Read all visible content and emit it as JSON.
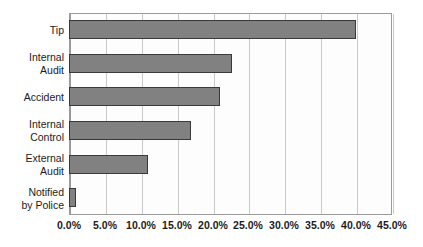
{
  "chart_data": {
    "type": "bar",
    "orientation": "horizontal",
    "title": "",
    "subtitle": "",
    "xlabel": "",
    "ylabel": "",
    "categories": [
      "Tip",
      "Internal\nAudit",
      "Accident",
      "Internal\nControl",
      "External\nAudit",
      "Notified\nby Police"
    ],
    "values": [
      40.0,
      22.7,
      21.0,
      17.0,
      11.0,
      1.0
    ],
    "value_labels": [
      "40.0%",
      "22.7%",
      "21.0%",
      "17.0%",
      "11.0%",
      "1.0%"
    ],
    "xlim": [
      0,
      45
    ],
    "xtick_values": [
      0,
      5,
      10,
      15,
      20,
      25,
      30,
      35,
      40,
      45
    ],
    "xtick_labels": [
      "0.0%",
      "5.0%",
      "10.0%",
      "15.0%",
      "20.0%",
      "25.0%",
      "30.0%",
      "35.0%",
      "40.0%",
      "45.0%"
    ],
    "grid": true,
    "grid_axis": "x",
    "legend": false,
    "legend_position": "none",
    "series": [
      {
        "name": "",
        "values": [
          40.0,
          22.7,
          21.0,
          17.0,
          11.0,
          1.0
        ]
      }
    ],
    "colors": {
      "bar_fill": "#818181",
      "bar_border": "#3a3a3a",
      "gridline": "#c9c9c9",
      "axis": "#9a9a9a",
      "plot_background": "#fdfdfd",
      "page_background": "#ffffff",
      "text": "#1b1b1b"
    }
  }
}
